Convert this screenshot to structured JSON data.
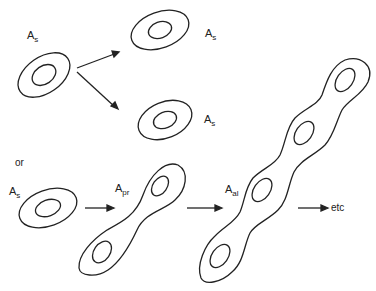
{
  "diagram": {
    "labels": {
      "as_source": {
        "main": "A",
        "sub": "s"
      },
      "as_top": {
        "main": "A",
        "sub": "s"
      },
      "as_bottom": {
        "main": "A",
        "sub": "s"
      },
      "as_row2": {
        "main": "A",
        "sub": "s"
      },
      "apr": {
        "main": "A",
        "sub": "pr"
      },
      "aal": {
        "main": "A",
        "sub": "al"
      }
    },
    "or_text": "or",
    "etc_text": "etc",
    "stroke_color": "#222222",
    "background": "#ffffff"
  }
}
